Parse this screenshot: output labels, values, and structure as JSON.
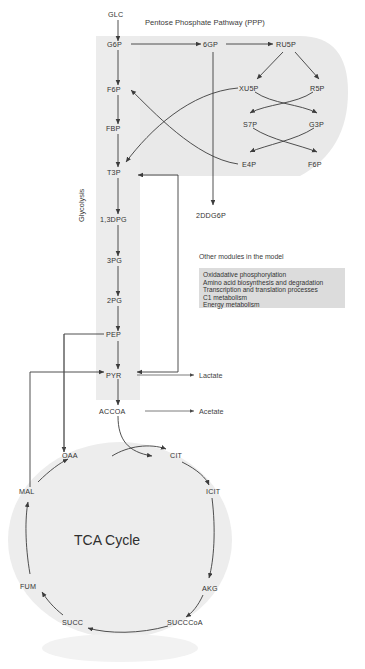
{
  "figure": {
    "sections": {
      "ppp_title": "Pentose Phosphate Pathway (PPP)",
      "glycolysis_label": "Glycolysis",
      "tca_title": "TCA Cycle"
    }
  },
  "inputs": [
    {
      "id": "glc",
      "label": "GLC"
    }
  ],
  "outputs": [
    {
      "id": "lactate",
      "label": "Lactate"
    },
    {
      "id": "acetate",
      "label": "Acetate"
    }
  ],
  "glycolysis": {
    "nodes": [
      {
        "id": "g6p",
        "label": "G6P"
      },
      {
        "id": "f6p",
        "label": "F6P"
      },
      {
        "id": "fbp",
        "label": "FBP"
      },
      {
        "id": "t3p",
        "label": "T3P"
      },
      {
        "id": "dpg13",
        "label": "1,3DPG"
      },
      {
        "id": "pg3",
        "label": "3PG"
      },
      {
        "id": "pg2",
        "label": "2PG"
      },
      {
        "id": "pep",
        "label": "PEP"
      },
      {
        "id": "pyr",
        "label": "PYR"
      },
      {
        "id": "accoa",
        "label": "ACCOA"
      }
    ]
  },
  "ppp": {
    "nodes": [
      {
        "id": "gp6",
        "label": "6GP"
      },
      {
        "id": "ru5p",
        "label": "RU5P"
      },
      {
        "id": "xu5p",
        "label": "XU5P"
      },
      {
        "id": "r5p",
        "label": "R5P"
      },
      {
        "id": "s7p",
        "label": "S7P"
      },
      {
        "id": "g3p",
        "label": "G3P"
      },
      {
        "id": "e4p",
        "label": "E4P"
      },
      {
        "id": "f6p_ppp",
        "label": "F6P"
      },
      {
        "id": "ddg6p",
        "label": "2DDG6P"
      }
    ]
  },
  "tca": {
    "nodes": [
      {
        "id": "oaa",
        "label": "OAA"
      },
      {
        "id": "cit",
        "label": "CIT"
      },
      {
        "id": "icit",
        "label": "ICIT"
      },
      {
        "id": "akg",
        "label": "AKG"
      },
      {
        "id": "succcoa",
        "label": "SUCCCoA"
      },
      {
        "id": "succ",
        "label": "SUCC"
      },
      {
        "id": "fum",
        "label": "FUM"
      },
      {
        "id": "mal",
        "label": "MAL"
      }
    ]
  },
  "other_modules": {
    "heading": "Other modules in the model",
    "items": [
      "Oxidadative phosphorylation",
      "Amino acid biosynthesis and degradation",
      "Transcription and translation processes",
      "C1 metabolism",
      "Energy metabolism"
    ]
  },
  "colors": {
    "region_fill": "#e9e9e9",
    "module_box_fill": "#dcdcdc",
    "edge": "#3c3c3c",
    "text": "#333333",
    "background": "#ffffff"
  }
}
